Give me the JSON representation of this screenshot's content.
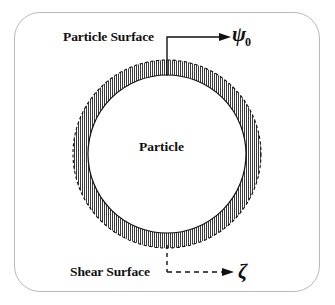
{
  "figure": {
    "type": "schematic-diagram",
    "frame": {
      "shape": "rounded-rectangle",
      "border_color": "#b9b9b9"
    },
    "labels": {
      "particle_surface": "Particle Surface",
      "particle": "Particle",
      "shear_surface": "Shear Surface"
    },
    "symbols": {
      "psi": "ψ",
      "psi_subscript": "0",
      "zeta": "ζ"
    },
    "geometry": {
      "center_x": 167,
      "center_y": 154,
      "outer_radius": 94,
      "inner_radius": 79,
      "annulus_fill": "vertical-hatch",
      "outer_boundary_style": "dashed",
      "inner_boundary_style": "solid",
      "hatch_color": "#2b2b2b",
      "line_color": "#111111"
    },
    "leaders": {
      "particle_surface_leader": "solid",
      "shear_surface_leader": "dashed"
    }
  }
}
